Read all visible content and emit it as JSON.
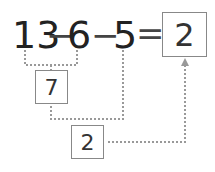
{
  "equation": {
    "a": "13",
    "op1": "−",
    "b": "6",
    "op2": "−",
    "c": "5",
    "eq": "=",
    "result": "2"
  },
  "steps": {
    "first_result": "7",
    "second_result": "2"
  },
  "colors": {
    "line": "#999999",
    "box_border": "#888888",
    "text": "#222222"
  }
}
